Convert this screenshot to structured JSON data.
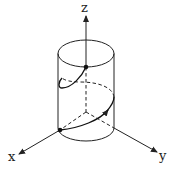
{
  "diagram": {
    "axes": {
      "z_label": "z",
      "x_label": "x",
      "y_label": "y"
    },
    "colors": {
      "stroke": "#222222",
      "background": "#ffffff"
    }
  }
}
